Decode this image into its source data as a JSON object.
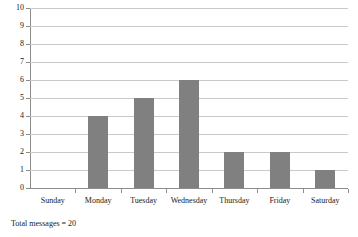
{
  "chart_data": {
    "type": "bar",
    "title": "",
    "xlabel": "",
    "ylabel": "",
    "categories": [
      "Sunday",
      "Monday",
      "Tuesday",
      "Wednesday",
      "Thursday",
      "Friday",
      "Saturday"
    ],
    "values": [
      0,
      4,
      5,
      6,
      2,
      2,
      1
    ],
    "ylim": [
      0,
      10
    ],
    "ytick_labels": [
      "10",
      "9",
      "8",
      "7",
      "6",
      "5",
      "4",
      "3",
      "2",
      "1",
      "0"
    ],
    "ytick_values": [
      10,
      9,
      8,
      7,
      6,
      5,
      4,
      3,
      2,
      1,
      0
    ],
    "ytick_step": 1,
    "grid": true,
    "legend": false,
    "bar_color": "#808080",
    "gridline_color": "#c9c9c9",
    "axis_color": "#8c8c8c",
    "text_color": "#1a1a1a",
    "annotations": [
      {
        "name": "total-messages",
        "text": "Total messages = 20"
      }
    ]
  },
  "caption": {
    "text": "Total messages = 20"
  }
}
